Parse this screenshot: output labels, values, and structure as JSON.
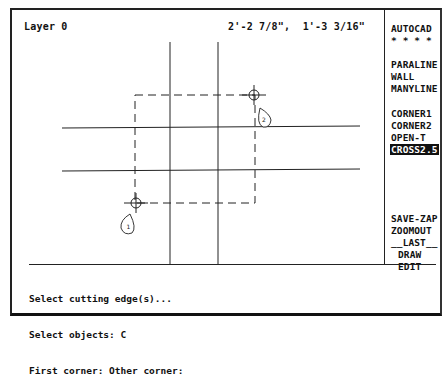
{
  "status_bar": {
    "layer": "Layer 0",
    "coordinates": "2'-2 7/8\",  1'-3 3/16\""
  },
  "screen_menu": {
    "items": [
      {
        "label": "AUTOCAD",
        "selected": false
      },
      {
        "label": "* * * *",
        "selected": false
      },
      {
        "label": "PARALINE",
        "selected": false
      },
      {
        "label": "WALL",
        "selected": false
      },
      {
        "label": "MANYLINE",
        "selected": false
      },
      {
        "label": "CORNER1",
        "selected": false
      },
      {
        "label": "CORNER2",
        "selected": false
      },
      {
        "label": "OPEN-T",
        "selected": false
      },
      {
        "label": "CROSS2.5",
        "selected": true
      },
      {
        "label": "SAVE-ZAP",
        "selected": false
      },
      {
        "label": "ZOOMOUT",
        "selected": false
      },
      {
        "label": "__LAST__",
        "selected": false
      },
      {
        "label": "DRAW",
        "selected": false
      },
      {
        "label": "EDIT",
        "selected": false
      }
    ]
  },
  "drawing": {
    "callouts": [
      {
        "label": "1",
        "position": "lower-left corner pick"
      },
      {
        "label": "2",
        "position": "upper-right corner pick"
      }
    ]
  },
  "command_line": {
    "lines": [
      "Select cutting edge(s)...",
      "Select objects: C",
      "First corner: Other corner:"
    ]
  },
  "colors": {
    "background": "#ffffff",
    "ink": "#111111",
    "highlight_bg": "#111111",
    "highlight_fg": "#ffffff"
  }
}
